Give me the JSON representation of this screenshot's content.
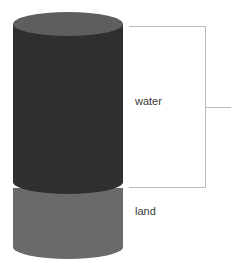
{
  "diagram": {
    "type": "cylinder-proportion",
    "segments": [
      {
        "name": "water",
        "label": "water",
        "color": "#2f2f2f",
        "top_color": "#5e5e5e"
      },
      {
        "name": "land",
        "label": "land",
        "color": "#6a6a6a"
      }
    ],
    "bracket": {
      "color": "#bbbbbb",
      "target": "water"
    }
  }
}
